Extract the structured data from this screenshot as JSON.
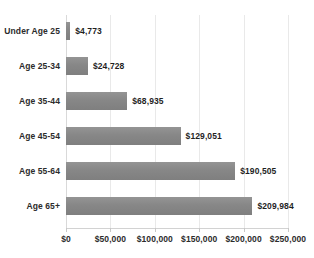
{
  "chart_data": {
    "type": "bar",
    "orientation": "horizontal",
    "title": "",
    "xlabel": "",
    "ylabel": "",
    "xlim": [
      0,
      250000
    ],
    "grid": true,
    "legend": false,
    "categories": [
      "Under Age 25",
      "Age 25-34",
      "Age 35-44",
      "Age 45-54",
      "Age 55-64",
      "Age 65+"
    ],
    "values": [
      4773,
      24728,
      68935,
      129051,
      190505,
      209984
    ],
    "value_labels": [
      "$4,773",
      "$24,728",
      "$68,935",
      "$129,051",
      "$190,505",
      "$209,984"
    ],
    "xticks": [
      0,
      50000,
      100000,
      150000,
      200000,
      250000
    ],
    "xtick_labels": [
      "$0",
      "$50,000",
      "$100,000",
      "$150,000",
      "$200,000",
      "$250,000"
    ],
    "bar_color": "#898989",
    "gridline_color": "#e9e9e9",
    "background_color": "#ffffff"
  }
}
